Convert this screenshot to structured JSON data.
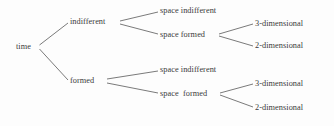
{
  "diagram": {
    "type": "tree",
    "title": "",
    "orientation": "left-to-right",
    "line_color": "#6b6b6b",
    "text_color": "#3a3a3a",
    "background_color": "#fdfdfd",
    "root": {
      "id": "time",
      "label": "time",
      "x": 16,
      "y": 47,
      "children": [
        {
          "id": "time-indifferent",
          "label": "indifferent",
          "x": 70,
          "y": 22,
          "children": [
            {
              "id": "ti-space-indifferent",
              "label": "space indifferent",
              "x": 160,
              "y": 11,
              "children": []
            },
            {
              "id": "ti-space-formed",
              "label": "space formed",
              "x": 160,
              "y": 35,
              "children": [
                {
                  "id": "ti-sf-3d",
                  "label": "3-dimensional",
                  "x": 255,
                  "y": 24,
                  "children": []
                },
                {
                  "id": "ti-sf-2d",
                  "label": "2-dimensional",
                  "x": 255,
                  "y": 46,
                  "children": []
                }
              ]
            }
          ]
        },
        {
          "id": "time-formed",
          "label": "formed",
          "x": 70,
          "y": 81,
          "children": [
            {
              "id": "tf-space-indifferent",
              "label": "space indifferent",
              "x": 160,
              "y": 70,
              "children": []
            },
            {
              "id": "tf-space-formed",
              "label": "space  formed",
              "x": 160,
              "y": 94,
              "children": [
                {
                  "id": "tf-sf-3d",
                  "label": "3-dimensional",
                  "x": 255,
                  "y": 84,
                  "children": []
                },
                {
                  "id": "tf-sf-2d",
                  "label": "2-dimensional",
                  "x": 255,
                  "y": 108,
                  "children": []
                }
              ]
            }
          ]
        }
      ]
    },
    "labels": {
      "root": "time",
      "level1_a": "indifferent",
      "level1_b": "formed",
      "level2_a1": "space indifferent",
      "level2_a2": "space formed",
      "level2_b1": "space indifferent",
      "level2_b2": "space  formed",
      "level3_a1": "3-dimensional",
      "level3_a2": "2-dimensional",
      "level3_b1": "3-dimensional",
      "level3_b2": "2-dimensional"
    }
  }
}
